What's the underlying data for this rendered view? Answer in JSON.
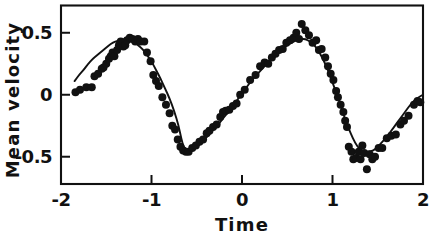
{
  "chart_data": {
    "type": "scatter",
    "title": "",
    "xlabel": "Time",
    "ylabel": "Mean velocity",
    "xlim": [
      -2,
      2
    ],
    "ylim": [
      -0.72,
      0.72
    ],
    "grid": false,
    "legend": "none",
    "x_ticks": [
      -2,
      -1,
      0,
      1,
      2
    ],
    "x_tick_labels": [
      "-2",
      "-1",
      "0",
      "1",
      "2"
    ],
    "y_ticks": [
      0.5,
      0,
      -0.5
    ],
    "y_tick_labels": [
      "0.5",
      "0",
      "-0.5"
    ],
    "tick_direction": "inward",
    "series": [
      {
        "name": "fitted curve",
        "type": "line",
        "form": "sinusoid",
        "amplitude": 0.45,
        "period": 2.0,
        "phase_peak_x": -1.3,
        "x_start": -1.85,
        "x_end": 2.0,
        "points": [
          [
            -1.85,
            0.11
          ],
          [
            -1.8,
            0.16
          ],
          [
            -1.75,
            0.2
          ],
          [
            -1.7,
            0.25
          ],
          [
            -1.65,
            0.29
          ],
          [
            -1.6,
            0.32
          ],
          [
            -1.55,
            0.35
          ],
          [
            -1.5,
            0.38
          ],
          [
            -1.45,
            0.41
          ],
          [
            -1.4,
            0.43
          ],
          [
            -1.35,
            0.44
          ],
          [
            -1.3,
            0.45
          ],
          [
            -1.25,
            0.44
          ],
          [
            -1.2,
            0.43
          ],
          [
            -1.15,
            0.4
          ],
          [
            -1.1,
            0.37
          ],
          [
            -1.05,
            0.32
          ],
          [
            -1.0,
            0.27
          ],
          [
            -0.95,
            0.2
          ],
          [
            -0.9,
            0.13
          ],
          [
            -0.85,
            0.05
          ],
          [
            -0.8,
            -0.03
          ],
          [
            -0.75,
            -0.13
          ],
          [
            -0.7,
            -0.25
          ],
          [
            -0.67,
            -0.36
          ],
          [
            -0.64,
            -0.43
          ],
          [
            -0.6,
            -0.45
          ],
          [
            -0.55,
            -0.44
          ],
          [
            -0.5,
            -0.42
          ],
          [
            -0.45,
            -0.39
          ],
          [
            -0.4,
            -0.35
          ],
          [
            -0.35,
            -0.31
          ],
          [
            -0.3,
            -0.27
          ],
          [
            -0.25,
            -0.23
          ],
          [
            -0.2,
            -0.18
          ],
          [
            -0.15,
            -0.14
          ],
          [
            -0.1,
            -0.09
          ],
          [
            -0.05,
            -0.04
          ],
          [
            0.0,
            0.01
          ],
          [
            0.05,
            0.06
          ],
          [
            0.1,
            0.11
          ],
          [
            0.15,
            0.15
          ],
          [
            0.2,
            0.19
          ],
          [
            0.25,
            0.23
          ],
          [
            0.3,
            0.27
          ],
          [
            0.35,
            0.31
          ],
          [
            0.4,
            0.34
          ],
          [
            0.45,
            0.37
          ],
          [
            0.5,
            0.4
          ],
          [
            0.55,
            0.42
          ],
          [
            0.6,
            0.44
          ],
          [
            0.65,
            0.45
          ],
          [
            0.7,
            0.45
          ],
          [
            0.75,
            0.43
          ],
          [
            0.8,
            0.4
          ],
          [
            0.85,
            0.35
          ],
          [
            0.9,
            0.28
          ],
          [
            0.95,
            0.2
          ],
          [
            1.0,
            0.1
          ],
          [
            1.05,
            0.0
          ],
          [
            1.1,
            -0.11
          ],
          [
            1.15,
            -0.22
          ],
          [
            1.2,
            -0.31
          ],
          [
            1.25,
            -0.39
          ],
          [
            1.3,
            -0.44
          ],
          [
            1.35,
            -0.46
          ],
          [
            1.4,
            -0.46
          ],
          [
            1.45,
            -0.45
          ],
          [
            1.5,
            -0.42
          ],
          [
            1.55,
            -0.38
          ],
          [
            1.6,
            -0.34
          ],
          [
            1.65,
            -0.29
          ],
          [
            1.7,
            -0.24
          ],
          [
            1.75,
            -0.19
          ],
          [
            1.8,
            -0.14
          ],
          [
            1.85,
            -0.09
          ],
          [
            1.9,
            -0.05
          ],
          [
            1.95,
            -0.02
          ],
          [
            2.0,
            0.0
          ]
        ]
      },
      {
        "name": "observations",
        "type": "scatter",
        "marker": "filled-circle",
        "marker_size": 5.2,
        "points": [
          [
            -1.84,
            0.02
          ],
          [
            -1.79,
            0.04
          ],
          [
            -1.72,
            0.06
          ],
          [
            -1.66,
            0.06
          ],
          [
            -1.63,
            0.15
          ],
          [
            -1.59,
            0.17
          ],
          [
            -1.55,
            0.21
          ],
          [
            -1.53,
            0.22
          ],
          [
            -1.5,
            0.25
          ],
          [
            -1.47,
            0.29
          ],
          [
            -1.45,
            0.31
          ],
          [
            -1.43,
            0.34
          ],
          [
            -1.41,
            0.31
          ],
          [
            -1.38,
            0.36
          ],
          [
            -1.36,
            0.4
          ],
          [
            -1.34,
            0.43
          ],
          [
            -1.31,
            0.39
          ],
          [
            -1.29,
            0.4
          ],
          [
            -1.27,
            0.44
          ],
          [
            -1.24,
            0.46
          ],
          [
            -1.21,
            0.45
          ],
          [
            -1.18,
            0.43
          ],
          [
            -1.15,
            0.45
          ],
          [
            -1.12,
            0.43
          ],
          [
            -1.08,
            0.43
          ],
          [
            -1.05,
            0.34
          ],
          [
            -1.01,
            0.27
          ],
          [
            -0.98,
            0.16
          ],
          [
            -0.95,
            0.11
          ],
          [
            -0.92,
            0.07
          ],
          [
            -0.88,
            -0.02
          ],
          [
            -0.84,
            -0.08
          ],
          [
            -0.8,
            -0.15
          ],
          [
            -0.77,
            -0.25
          ],
          [
            -0.74,
            -0.28
          ],
          [
            -0.71,
            -0.36
          ],
          [
            -0.68,
            -0.42
          ],
          [
            -0.65,
            -0.45
          ],
          [
            -0.62,
            -0.46
          ],
          [
            -0.59,
            -0.46
          ],
          [
            -0.55,
            -0.43
          ],
          [
            -0.51,
            -0.41
          ],
          [
            -0.47,
            -0.38
          ],
          [
            -0.43,
            -0.36
          ],
          [
            -0.39,
            -0.31
          ],
          [
            -0.36,
            -0.29
          ],
          [
            -0.32,
            -0.26
          ],
          [
            -0.28,
            -0.24
          ],
          [
            -0.24,
            -0.18
          ],
          [
            -0.21,
            -0.14
          ],
          [
            -0.18,
            -0.13
          ],
          [
            -0.14,
            -0.12
          ],
          [
            -0.1,
            -0.09
          ],
          [
            -0.06,
            -0.07
          ],
          [
            -0.02,
            0.0
          ],
          [
            0.03,
            0.04
          ],
          [
            0.09,
            0.12
          ],
          [
            0.15,
            0.16
          ],
          [
            0.2,
            0.23
          ],
          [
            0.25,
            0.26
          ],
          [
            0.29,
            0.25
          ],
          [
            0.33,
            0.3
          ],
          [
            0.37,
            0.33
          ],
          [
            0.41,
            0.36
          ],
          [
            0.45,
            0.37
          ],
          [
            0.49,
            0.42
          ],
          [
            0.53,
            0.44
          ],
          [
            0.57,
            0.46
          ],
          [
            0.6,
            0.5
          ],
          [
            0.63,
            0.45
          ],
          [
            0.66,
            0.57
          ],
          [
            0.7,
            0.52
          ],
          [
            0.74,
            0.48
          ],
          [
            0.78,
            0.42
          ],
          [
            0.82,
            0.44
          ],
          [
            0.85,
            0.36
          ],
          [
            0.88,
            0.37
          ],
          [
            0.92,
            0.3
          ],
          [
            0.95,
            0.23
          ],
          [
            0.98,
            0.17
          ],
          [
            1.01,
            0.12
          ],
          [
            1.04,
            0.03
          ],
          [
            1.06,
            -0.02
          ],
          [
            1.09,
            -0.08
          ],
          [
            1.12,
            -0.14
          ],
          [
            1.14,
            -0.21
          ],
          [
            1.16,
            -0.26
          ],
          [
            1.18,
            -0.42
          ],
          [
            1.21,
            -0.46
          ],
          [
            1.23,
            -0.52
          ],
          [
            1.26,
            -0.51
          ],
          [
            1.29,
            -0.46
          ],
          [
            1.31,
            -0.52
          ],
          [
            1.33,
            -0.41
          ],
          [
            1.35,
            -0.47
          ],
          [
            1.38,
            -0.6
          ],
          [
            1.41,
            -0.48
          ],
          [
            1.44,
            -0.52
          ],
          [
            1.47,
            -0.5
          ],
          [
            1.51,
            -0.43
          ],
          [
            1.55,
            -0.43
          ],
          [
            1.6,
            -0.35
          ],
          [
            1.65,
            -0.33
          ],
          [
            1.7,
            -0.32
          ],
          [
            1.75,
            -0.24
          ],
          [
            1.79,
            -0.21
          ],
          [
            1.84,
            -0.17
          ],
          [
            1.9,
            -0.08
          ],
          [
            1.94,
            -0.05
          ],
          [
            1.97,
            -0.06
          ]
        ]
      }
    ]
  },
  "axes": {
    "x_title": "Time",
    "y_title": "Mean velocity",
    "x_tick_labels": [
      "-2",
      "-1",
      "0",
      "1",
      "2"
    ],
    "y_tick_labels": [
      "0.5",
      "0",
      "-0.5"
    ]
  },
  "style": {
    "ink_color": "#111111",
    "background": "#ffffff"
  }
}
